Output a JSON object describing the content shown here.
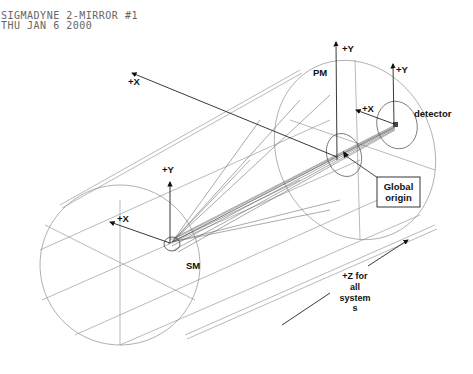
{
  "header": {
    "line1": "SIGMADYNE 2-MIRROR #1",
    "line2": "THU JAN 6 2000"
  },
  "labels": {
    "pm": "PM",
    "sm": "SM",
    "detector": "detector",
    "global_origin_line1": "Global",
    "global_origin_line2": "origin",
    "pm_y": "+Y",
    "pm_x": "+X",
    "det_y": "+Y",
    "det_x": "+X",
    "sm_y": "+Y",
    "sm_x": "+X",
    "z_line1": "+Z for",
    "z_line2": "all",
    "z_line3": "system",
    "z_line4": "s"
  }
}
